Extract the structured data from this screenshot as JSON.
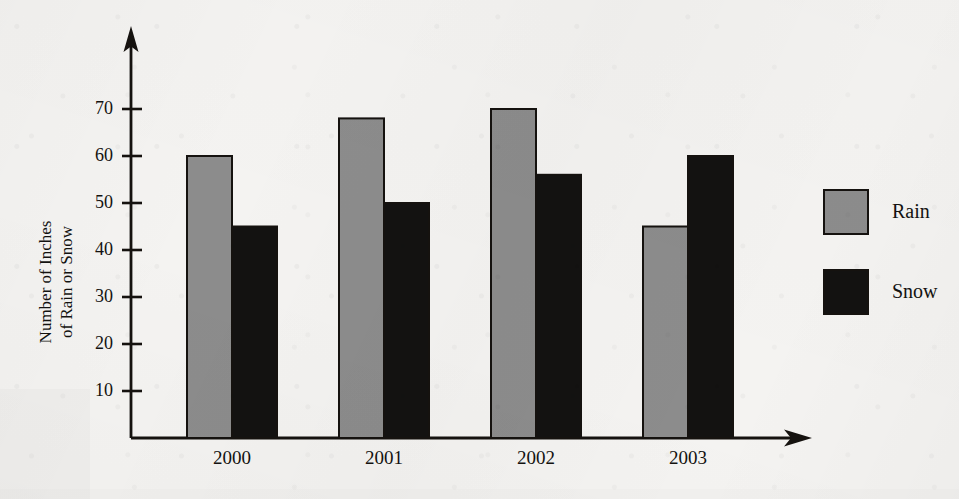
{
  "chart_data": {
    "type": "bar",
    "title": "",
    "xlabel": "",
    "ylabel": "Number of Inches of Rain or Snow",
    "ylabel_line1": "Number of Inches",
    "ylabel_line2": "of Rain or Snow",
    "categories": [
      "2000",
      "2001",
      "2002",
      "2003"
    ],
    "series": [
      {
        "name": "Rain",
        "color": "#8c8c8c",
        "values": [
          60,
          68,
          70,
          45
        ]
      },
      {
        "name": "Snow",
        "color": "#131211",
        "values": [
          45,
          50,
          56,
          60
        ]
      }
    ],
    "ylim": [
      0,
      75
    ],
    "yticks": [
      10,
      20,
      30,
      40,
      50,
      60,
      70
    ],
    "ytick_labels": [
      "10",
      "20",
      "30",
      "40",
      "50",
      "60",
      "70"
    ],
    "grid": false,
    "legend_position": "right",
    "legend": [
      {
        "label": "Rain",
        "color": "#8c8c8c"
      },
      {
        "label": "Snow",
        "color": "#131211"
      }
    ],
    "axis_style": "arrow-terminated"
  }
}
